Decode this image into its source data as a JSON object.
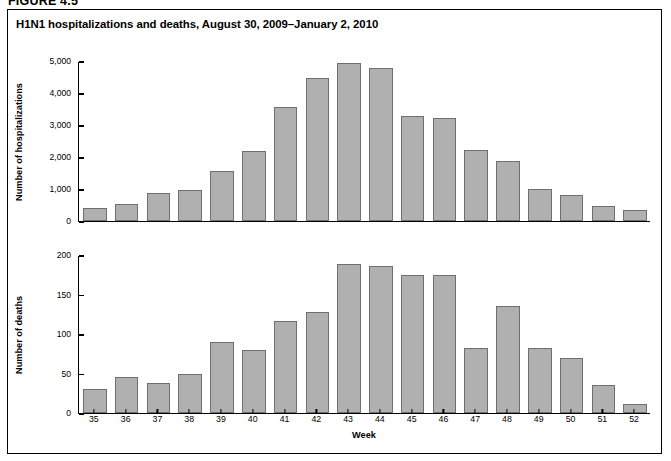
{
  "figure": {
    "number_label": "FIGURE 4.5",
    "title": "H1N1 hospitalizations and deaths, August 30, 2009–January 2, 2010",
    "frame_color": "#000000",
    "bar_fill": "#b0b0b0",
    "bar_stroke": "#6f6f6f"
  },
  "chart_data": [
    {
      "type": "bar",
      "title": "H1N1 hospitalizations and deaths, August 30, 2009–January 2, 2010",
      "panel": "hospitalizations",
      "xlabel": "Week",
      "ylabel": "Number of hospitalizations",
      "categories": [
        "35",
        "36",
        "37",
        "38",
        "39",
        "40",
        "41",
        "42",
        "43",
        "44",
        "45",
        "46",
        "47",
        "48",
        "49",
        "50",
        "51",
        "52"
      ],
      "values": [
        420,
        540,
        860,
        960,
        1550,
        2200,
        3550,
        4470,
        4950,
        4780,
        3290,
        3230,
        2210,
        1860,
        1000,
        820,
        460,
        340
      ],
      "ylim": [
        0,
        5000
      ],
      "yticks": [
        0,
        1000,
        2000,
        3000,
        4000,
        5000
      ],
      "ytick_labels": [
        "0",
        "1,000",
        "2,000",
        "3,000",
        "4,000",
        "5,000"
      ],
      "grid": false,
      "legend": "none"
    },
    {
      "type": "bar",
      "panel": "deaths",
      "xlabel": "Week",
      "ylabel": "Number of deaths",
      "categories": [
        "35",
        "36",
        "37",
        "38",
        "39",
        "40",
        "41",
        "42",
        "43",
        "44",
        "45",
        "46",
        "47",
        "48",
        "49",
        "50",
        "51",
        "52"
      ],
      "values": [
        30,
        46,
        38,
        49,
        90,
        80,
        117,
        128,
        189,
        186,
        175,
        175,
        82,
        135,
        82,
        70,
        36,
        12
      ],
      "ylim": [
        0,
        200
      ],
      "yticks": [
        0,
        50,
        100,
        150,
        200
      ],
      "ytick_labels": [
        "0",
        "50",
        "100",
        "150",
        "200"
      ],
      "grid": false,
      "legend": "none"
    }
  ]
}
